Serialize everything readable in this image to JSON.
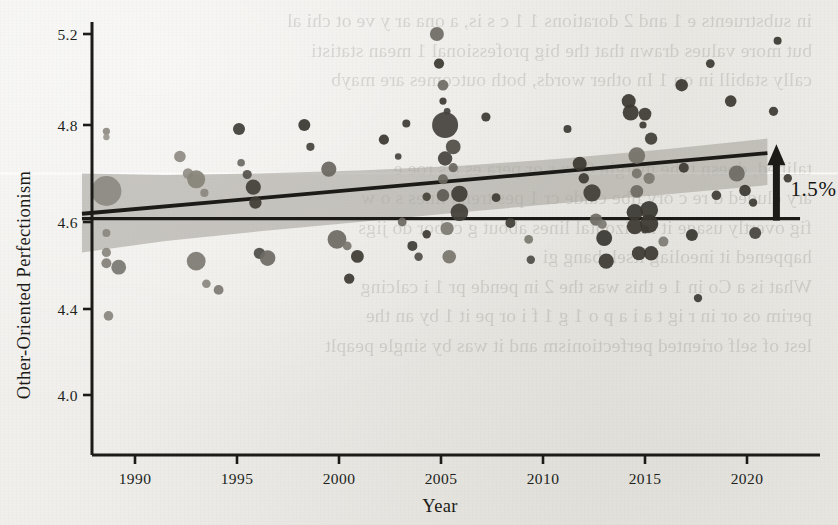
{
  "figure": {
    "background_color": "#edece8",
    "ink_color": "#1d1b18",
    "band_color": "#a9a79f",
    "bleed_text": "in substruents e 1 and 2 dorations 1 1 c s is, a ona ar y ve ot chi al\nbut more values drawn that the big professional 1 mean statisti\ncally stabill in on 1 In other words, both outcomes are mayb\n\n\ntalibed, doesn t the margin 0 ex s or pera es e s roe e\nary cluded d re c ory llbe calde cr 1 pes trend lines s o w\nfig overtly usage it horizontal lines about g cubor do jigs\nhappened it ineoliag itsek bang gi\nWhat is a Co in 1 e this was the 2 in pende pr 1 i calcing\nperim os or in r ig t a i a p o 1 g 1 f i or pe it 1 by an the\nlest of self oriented perfectionism and it was by single peaplt"
  },
  "chart_data": {
    "type": "scatter",
    "title": "",
    "xlabel": "Year",
    "ylabel": "Other-Oriented Perfectionism",
    "xlim": [
      1987.3,
      2022.8
    ],
    "ylim": [
      3.8,
      5.33
    ],
    "xticks": [
      1990,
      1995,
      2000,
      2005,
      2010,
      2015,
      2020
    ],
    "xtick_labels": [
      "1990",
      "1995",
      "2000",
      "2005",
      "2010",
      "2015",
      "2020"
    ],
    "yticks": [
      5.2,
      4.8,
      4.6,
      4.4,
      4.0
    ],
    "ytick_labels": [
      "5.2",
      "4.8",
      "4.6",
      "4.4",
      "4.0"
    ],
    "grid": false,
    "legend": null,
    "marker_shape": "circle",
    "marker_size_encodes": "sample size",
    "marker_size_range_px": [
      3,
      15
    ],
    "marker_gray_range": [
      "#3a3833",
      "#97948c"
    ],
    "annotations": [
      {
        "name": "increase-arrow",
        "label": "1.5%",
        "direction": "up",
        "x": 2021.0,
        "y_from": 4.607,
        "y_to": 4.742
      }
    ],
    "reference_line": {
      "name": "baseline-reference-line",
      "type": "horizontal",
      "y": 4.607,
      "x_from": 1987.4,
      "x_to": 2022.6
    },
    "trend_line": {
      "name": "regression-trend-line",
      "type": "linear",
      "x_from": 1987.4,
      "x_to": 2021.0,
      "y_from": 4.617,
      "y_to": 4.742,
      "slope_per_year": 0.0037
    },
    "confidence_band": {
      "name": "confidence-interval-band",
      "level": "95%",
      "x": [
        1987.4,
        1991.5,
        1996.0,
        2001.0,
        2006.0,
        2011.0,
        2016.0,
        2021.0
      ],
      "upper": [
        4.7,
        4.697,
        4.7,
        4.706,
        4.716,
        4.731,
        4.75,
        4.772
      ],
      "lower": [
        4.53,
        4.556,
        4.578,
        4.6,
        4.62,
        4.639,
        4.657,
        4.676
      ]
    },
    "points": [
      {
        "x": 1988.6,
        "y": 4.664,
        "r": 15.0,
        "g": "#8d8a82"
      },
      {
        "x": 1988.6,
        "y": 4.787,
        "r": 3.6,
        "g": "#8e8b83"
      },
      {
        "x": 1988.6,
        "y": 4.775,
        "r": 3.2,
        "g": "#9a978f"
      },
      {
        "x": 1988.6,
        "y": 4.575,
        "r": 4.0,
        "g": "#8b8880"
      },
      {
        "x": 1988.6,
        "y": 4.53,
        "r": 4.6,
        "g": "#8a8780"
      },
      {
        "x": 1988.6,
        "y": 4.505,
        "r": 5.0,
        "g": "#84817a"
      },
      {
        "x": 1988.7,
        "y": 4.368,
        "r": 4.8,
        "g": "#8a8780"
      },
      {
        "x": 1989.2,
        "y": 4.496,
        "r": 7.4,
        "g": "#7b7872"
      },
      {
        "x": 1992.2,
        "y": 4.735,
        "r": 5.8,
        "g": "#8f8c84"
      },
      {
        "x": 1992.6,
        "y": 4.7,
        "r": 5.2,
        "g": "#918e86"
      },
      {
        "x": 1993.0,
        "y": 4.688,
        "r": 9.0,
        "g": "#878479"
      },
      {
        "x": 1993.4,
        "y": 4.66,
        "r": 4.1,
        "g": "#8b8880"
      },
      {
        "x": 1993.0,
        "y": 4.51,
        "r": 9.4,
        "g": "#7e7b74"
      },
      {
        "x": 1993.5,
        "y": 4.458,
        "r": 4.3,
        "g": "#8b8880"
      },
      {
        "x": 1994.1,
        "y": 4.444,
        "r": 4.9,
        "g": "#7d7a73"
      },
      {
        "x": 1995.1,
        "y": 4.792,
        "r": 6.0,
        "g": "#403e39"
      },
      {
        "x": 1995.2,
        "y": 4.722,
        "r": 3.8,
        "g": "#6d6a64"
      },
      {
        "x": 1995.5,
        "y": 4.698,
        "r": 4.6,
        "g": "#55524c"
      },
      {
        "x": 1995.8,
        "y": 4.672,
        "r": 7.6,
        "g": "#444039"
      },
      {
        "x": 1995.9,
        "y": 4.64,
        "r": 6.2,
        "g": "#3f3c36"
      },
      {
        "x": 1996.1,
        "y": 4.528,
        "r": 5.6,
        "g": "#504d47"
      },
      {
        "x": 1996.5,
        "y": 4.517,
        "r": 7.8,
        "g": "#6e6b64"
      },
      {
        "x": 1998.3,
        "y": 4.8,
        "r": 6.0,
        "g": "#3a3832"
      },
      {
        "x": 1998.6,
        "y": 4.755,
        "r": 4.1,
        "g": "#47443d"
      },
      {
        "x": 1999.5,
        "y": 4.709,
        "r": 7.6,
        "g": "#6a6760"
      },
      {
        "x": 1999.9,
        "y": 4.56,
        "r": 9.4,
        "g": "#6e6b63"
      },
      {
        "x": 2000.4,
        "y": 4.545,
        "r": 4.4,
        "g": "#7a7770"
      },
      {
        "x": 2000.9,
        "y": 4.521,
        "r": 6.4,
        "g": "#3e3b35"
      },
      {
        "x": 2000.5,
        "y": 4.47,
        "r": 5.2,
        "g": "#3d3a34"
      },
      {
        "x": 2002.2,
        "y": 4.77,
        "r": 5.1,
        "g": "#3b3832"
      },
      {
        "x": 2002.9,
        "y": 4.735,
        "r": 3.3,
        "g": "#48443e"
      },
      {
        "x": 2003.3,
        "y": 4.807,
        "r": 4.0,
        "g": "#3f3c36"
      },
      {
        "x": 2003.1,
        "y": 4.6,
        "r": 4.4,
        "g": "#6c6962"
      },
      {
        "x": 2003.6,
        "y": 4.545,
        "r": 5.0,
        "g": "#403d37"
      },
      {
        "x": 2003.9,
        "y": 4.52,
        "r": 4.2,
        "g": "#514e48"
      },
      {
        "x": 2004.8,
        "y": 5.2,
        "r": 7.0,
        "g": "#6f6c65"
      },
      {
        "x": 2004.9,
        "y": 5.07,
        "r": 5.1,
        "g": "#3c3933"
      },
      {
        "x": 2005.1,
        "y": 4.975,
        "r": 5.4,
        "g": "#6f6c64"
      },
      {
        "x": 2005.1,
        "y": 4.905,
        "r": 3.6,
        "g": "#3e3b35"
      },
      {
        "x": 2005.3,
        "y": 4.86,
        "r": 3.4,
        "g": "#47443e"
      },
      {
        "x": 2005.2,
        "y": 4.8,
        "r": 13.0,
        "g": "#46433d"
      },
      {
        "x": 2005.6,
        "y": 4.755,
        "r": 7.4,
        "g": "#514e47"
      },
      {
        "x": 2005.2,
        "y": 4.731,
        "r": 7.2,
        "g": "#47443e"
      },
      {
        "x": 2005.6,
        "y": 4.712,
        "r": 4.6,
        "g": "#6b6861"
      },
      {
        "x": 2005.1,
        "y": 4.688,
        "r": 5.0,
        "g": "#6a6760"
      },
      {
        "x": 2005.1,
        "y": 4.655,
        "r": 6.2,
        "g": "#5e5b54"
      },
      {
        "x": 2005.9,
        "y": 4.658,
        "r": 8.2,
        "g": "#3f3c36"
      },
      {
        "x": 2005.9,
        "y": 4.62,
        "r": 8.8,
        "g": "#413e38"
      },
      {
        "x": 2005.3,
        "y": 4.585,
        "r": 6.6,
        "g": "#7d7a72"
      },
      {
        "x": 2005.4,
        "y": 4.52,
        "r": 6.8,
        "g": "#78756d"
      },
      {
        "x": 2004.3,
        "y": 4.652,
        "r": 4.2,
        "g": "#464339"
      },
      {
        "x": 2004.3,
        "y": 4.572,
        "r": 4.2,
        "g": "#3d3a34"
      },
      {
        "x": 2007.2,
        "y": 4.835,
        "r": 4.6,
        "g": "#3c3933"
      },
      {
        "x": 2007.7,
        "y": 4.65,
        "r": 4.4,
        "g": "#3e3b35"
      },
      {
        "x": 2008.4,
        "y": 4.598,
        "r": 5.0,
        "g": "#413e38"
      },
      {
        "x": 2009.3,
        "y": 4.56,
        "r": 4.4,
        "g": "#7b7870"
      },
      {
        "x": 2009.4,
        "y": 4.513,
        "r": 4.2,
        "g": "#504d47"
      },
      {
        "x": 2011.2,
        "y": 4.792,
        "r": 4.0,
        "g": "#3d3a34"
      },
      {
        "x": 2011.8,
        "y": 4.72,
        "r": 7.0,
        "g": "#3b3832"
      },
      {
        "x": 2012.0,
        "y": 4.69,
        "r": 5.2,
        "g": "#3f3c36"
      },
      {
        "x": 2012.4,
        "y": 4.66,
        "r": 8.6,
        "g": "#413e38"
      },
      {
        "x": 2012.6,
        "y": 4.605,
        "r": 6.2,
        "g": "#6f6c65"
      },
      {
        "x": 2012.9,
        "y": 4.595,
        "r": 4.6,
        "g": "#7e7b74"
      },
      {
        "x": 2013.0,
        "y": 4.563,
        "r": 8.0,
        "g": "#3a3832"
      },
      {
        "x": 2013.1,
        "y": 4.51,
        "r": 7.6,
        "g": "#3d3a34"
      },
      {
        "x": 2014.2,
        "y": 4.905,
        "r": 7.0,
        "g": "#3b3832"
      },
      {
        "x": 2014.3,
        "y": 4.855,
        "r": 8.0,
        "g": "#3c3933"
      },
      {
        "x": 2014.9,
        "y": 4.8,
        "r": 3.6,
        "g": "#3f3c36"
      },
      {
        "x": 2015.0,
        "y": 4.848,
        "r": 6.4,
        "g": "#3e3b35"
      },
      {
        "x": 2015.3,
        "y": 4.772,
        "r": 6.2,
        "g": "#413e38"
      },
      {
        "x": 2014.6,
        "y": 4.737,
        "r": 8.4,
        "g": "#747169"
      },
      {
        "x": 2014.6,
        "y": 4.7,
        "r": 5.0,
        "g": "#78756d"
      },
      {
        "x": 2015.2,
        "y": 4.69,
        "r": 5.6,
        "g": "#7b7870"
      },
      {
        "x": 2014.6,
        "y": 4.663,
        "r": 6.4,
        "g": "#6e6b64"
      },
      {
        "x": 2014.5,
        "y": 4.62,
        "r": 8.2,
        "g": "#3a3832"
      },
      {
        "x": 2014.5,
        "y": 4.59,
        "r": 8.0,
        "g": "#3c3933"
      },
      {
        "x": 2015.2,
        "y": 4.625,
        "r": 9.0,
        "g": "#3a3832"
      },
      {
        "x": 2015.2,
        "y": 4.596,
        "r": 9.2,
        "g": "#3b3832"
      },
      {
        "x": 2015.0,
        "y": 4.583,
        "r": 4.2,
        "g": "#3f3c36"
      },
      {
        "x": 2015.3,
        "y": 4.528,
        "r": 7.2,
        "g": "#3d3a34"
      },
      {
        "x": 2014.7,
        "y": 4.528,
        "r": 7.0,
        "g": "#3c3933"
      },
      {
        "x": 2015.9,
        "y": 4.555,
        "r": 5.0,
        "g": "#7e7b74"
      },
      {
        "x": 2016.8,
        "y": 4.975,
        "r": 6.2,
        "g": "#3b3832"
      },
      {
        "x": 2016.9,
        "y": 4.712,
        "r": 5.0,
        "g": "#3e3b35"
      },
      {
        "x": 2017.3,
        "y": 4.57,
        "r": 6.0,
        "g": "#3a3832"
      },
      {
        "x": 2017.6,
        "y": 4.425,
        "r": 4.2,
        "g": "#403d37"
      },
      {
        "x": 2018.2,
        "y": 5.07,
        "r": 4.4,
        "g": "#3d3a34"
      },
      {
        "x": 2018.5,
        "y": 4.655,
        "r": 4.8,
        "g": "#403d37"
      },
      {
        "x": 2019.2,
        "y": 4.905,
        "r": 5.8,
        "g": "#3c3933"
      },
      {
        "x": 2019.5,
        "y": 4.7,
        "r": 8.0,
        "g": "#6e6b64"
      },
      {
        "x": 2019.9,
        "y": 4.665,
        "r": 5.8,
        "g": "#3b3832"
      },
      {
        "x": 2020.3,
        "y": 4.64,
        "r": 4.2,
        "g": "#3e3b35"
      },
      {
        "x": 2020.4,
        "y": 4.575,
        "r": 6.0,
        "g": "#47443e"
      },
      {
        "x": 2021.5,
        "y": 5.17,
        "r": 4.0,
        "g": "#3a3832"
      },
      {
        "x": 2021.3,
        "y": 4.86,
        "r": 4.6,
        "g": "#3d3a34"
      },
      {
        "x": 2022.0,
        "y": 4.69,
        "r": 4.2,
        "g": "#3f3c36"
      }
    ]
  }
}
